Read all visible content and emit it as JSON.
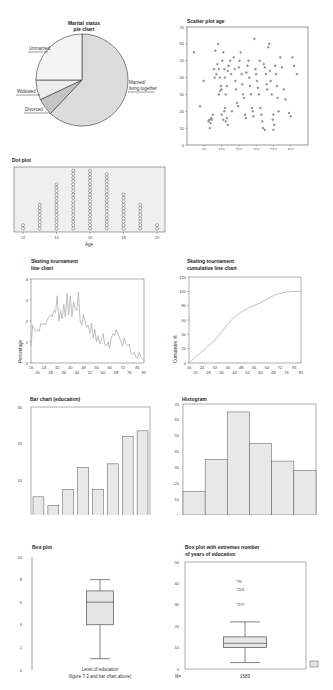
{
  "chart_data": [
    {
      "id": "pie",
      "type": "pie",
      "title": "Marital status pie chart",
      "categories": [
        "Married/ living together",
        "Divorced",
        "Widowed",
        "Unmarried"
      ],
      "values": [
        62,
        6,
        7,
        25
      ],
      "colors": [
        "#dcdcdc",
        "#c4c4c4",
        "#ececec",
        "#f4f4f4"
      ]
    },
    {
      "id": "scatter",
      "type": "scatter",
      "title": "Scatter plot age",
      "xlim": [
        0,
        350
      ],
      "ylim": [
        0,
        70
      ],
      "xticks": [
        50,
        100,
        150,
        200,
        250,
        300
      ],
      "yticks": [
        0,
        10,
        20,
        30,
        40,
        50,
        60,
        70
      ],
      "points": [
        [
          20,
          55
        ],
        [
          38,
          23
        ],
        [
          48,
          38
        ],
        [
          62,
          14
        ],
        [
          65,
          15
        ],
        [
          68,
          13
        ],
        [
          70,
          16
        ],
        [
          72,
          15
        ],
        [
          66,
          10
        ],
        [
          75,
          18
        ],
        [
          78,
          45
        ],
        [
          80,
          40
        ],
        [
          82,
          56
        ],
        [
          85,
          42
        ],
        [
          88,
          48
        ],
        [
          90,
          60
        ],
        [
          92,
          45
        ],
        [
          95,
          40
        ],
        [
          98,
          35
        ],
        [
          100,
          33
        ],
        [
          92,
          30
        ],
        [
          96,
          32
        ],
        [
          100,
          18
        ],
        [
          105,
          15
        ],
        [
          108,
          20
        ],
        [
          110,
          22
        ],
        [
          112,
          14
        ],
        [
          115,
          16
        ],
        [
          118,
          12
        ],
        [
          102,
          50
        ],
        [
          105,
          55
        ],
        [
          108,
          45
        ],
        [
          110,
          40
        ],
        [
          112,
          30
        ],
        [
          115,
          35
        ],
        [
          118,
          44
        ],
        [
          120,
          47
        ],
        [
          125,
          50
        ],
        [
          128,
          42
        ],
        [
          130,
          20
        ],
        [
          135,
          52
        ],
        [
          138,
          45
        ],
        [
          140,
          38
        ],
        [
          142,
          33
        ],
        [
          145,
          25
        ],
        [
          148,
          23
        ],
        [
          150,
          46
        ],
        [
          152,
          50
        ],
        [
          155,
          55
        ],
        [
          158,
          42
        ],
        [
          160,
          36
        ],
        [
          162,
          30
        ],
        [
          165,
          28
        ],
        [
          168,
          18
        ],
        [
          170,
          16
        ],
        [
          172,
          43
        ],
        [
          175,
          47
        ],
        [
          178,
          50
        ],
        [
          180,
          40
        ],
        [
          182,
          35
        ],
        [
          185,
          30
        ],
        [
          188,
          22
        ],
        [
          190,
          20
        ],
        [
          192,
          17
        ],
        [
          195,
          63
        ],
        [
          198,
          45
        ],
        [
          200,
          42
        ],
        [
          202,
          38
        ],
        [
          205,
          34
        ],
        [
          208,
          30
        ],
        [
          210,
          50
        ],
        [
          212,
          22
        ],
        [
          215,
          18
        ],
        [
          218,
          14
        ],
        [
          220,
          10
        ],
        [
          222,
          48
        ],
        [
          225,
          46
        ],
        [
          228,
          42
        ],
        [
          230,
          36
        ],
        [
          232,
          33
        ],
        [
          235,
          58
        ],
        [
          238,
          60
        ],
        [
          240,
          44
        ],
        [
          242,
          38
        ],
        [
          245,
          30
        ],
        [
          248,
          15
        ],
        [
          250,
          18
        ],
        [
          252,
          12
        ],
        [
          255,
          47
        ],
        [
          258,
          42
        ],
        [
          260,
          35
        ],
        [
          262,
          28
        ],
        [
          265,
          20
        ],
        [
          270,
          52
        ],
        [
          275,
          46
        ],
        [
          280,
          33
        ],
        [
          285,
          27
        ],
        [
          295,
          19
        ],
        [
          300,
          17
        ],
        [
          305,
          52
        ],
        [
          310,
          47
        ],
        [
          318,
          42
        ],
        [
          250,
          9
        ],
        [
          225,
          9
        ]
      ]
    },
    {
      "id": "dotplot",
      "type": "scatter",
      "title": "Dot plot",
      "xlabel": "Age",
      "xticks": [
        12,
        14,
        16,
        18,
        20
      ],
      "categories": [
        12,
        13,
        14,
        15,
        16,
        17,
        18,
        19,
        20
      ],
      "values": [
        2,
        8,
        14,
        18,
        18,
        17,
        11,
        8,
        2
      ]
    },
    {
      "id": "line",
      "type": "line",
      "title": "Skating tournament line chart",
      "ylabel": "Percentage",
      "ylim": [
        0,
        4
      ],
      "yticks": [
        0,
        1,
        2,
        3,
        4
      ],
      "xticks_top": [
        16,
        24,
        32,
        40,
        48,
        56,
        64,
        72,
        81
      ],
      "xticks_bottom": [
        20,
        28,
        36,
        44,
        52,
        60,
        68,
        76,
        85
      ],
      "x": [
        16,
        17,
        18,
        19,
        20,
        21,
        22,
        23,
        24,
        25,
        26,
        27,
        28,
        29,
        30,
        31,
        32,
        33,
        34,
        35,
        36,
        37,
        38,
        39,
        40,
        41,
        42,
        43,
        44,
        45,
        46,
        47,
        48,
        49,
        50,
        51,
        52,
        53,
        54,
        55,
        56,
        57,
        58,
        59,
        60,
        61,
        62,
        63,
        64,
        65,
        66,
        67,
        68,
        69,
        70,
        71,
        72,
        73,
        74,
        75,
        76,
        77,
        78,
        79,
        80,
        81,
        82,
        83,
        84,
        85
      ],
      "values": [
        0.8,
        1.8,
        1.6,
        1.5,
        1.6,
        1.5,
        1.9,
        1.8,
        1.9,
        1.8,
        2.1,
        2.2,
        2.3,
        2.2,
        2.5,
        2.4,
        3.2,
        2.0,
        2.5,
        2.1,
        2.8,
        2.2,
        3.3,
        2.3,
        3.2,
        2.2,
        2.9,
        2.6,
        2.5,
        3.4,
        2.0,
        1.8,
        2.3,
        2.0,
        1.7,
        1.8,
        1.4,
        1.9,
        1.2,
        1.6,
        1.0,
        1.3,
        0.9,
        1.1,
        1.4,
        0.9,
        0.8,
        1.0,
        0.7,
        1.2,
        1.4,
        1.3,
        1.6,
        1.4,
        1.2,
        1.0,
        0.8,
        1.2,
        0.9,
        0.8,
        0.9,
        0.5,
        0.4,
        0.5,
        0.3,
        0.2,
        0.5,
        0.3,
        0.2,
        0.1
      ]
    },
    {
      "id": "cumulative",
      "type": "line",
      "title": "Skating tournament cumulative line chart",
      "ylabel": "Cumulative %",
      "ylim": [
        0,
        120
      ],
      "yticks": [
        0,
        20,
        40,
        60,
        80,
        100,
        120
      ],
      "xticks_top": [
        16,
        24,
        32,
        40,
        48,
        56,
        64,
        72,
        81
      ],
      "xticks_bottom": [
        20,
        28,
        36,
        44,
        52,
        60,
        68,
        76,
        85
      ],
      "x": [
        16,
        20,
        24,
        28,
        32,
        36,
        40,
        44,
        48,
        52,
        56,
        60,
        64,
        68,
        72,
        76,
        81,
        85
      ],
      "values": [
        0,
        8,
        16,
        24,
        32,
        43,
        55,
        64,
        71,
        76,
        80,
        84,
        89,
        94,
        97,
        99,
        100,
        100
      ]
    },
    {
      "id": "bar",
      "type": "bar",
      "title": "Bar chart (education)",
      "ylim": [
        0,
        30
      ],
      "yticks": [
        0,
        10,
        20,
        30
      ],
      "categories": [
        "LO",
        "LBO",
        "MAVO",
        "MBO",
        "HAVO",
        "VWO",
        "HBO",
        "WO"
      ],
      "values": [
        5.5,
        3.2,
        7.5,
        13.5,
        7.5,
        14.5,
        22,
        23.5
      ]
    },
    {
      "id": "histogram",
      "type": "bar",
      "title": "Histogram",
      "ylim": [
        0,
        70
      ],
      "yticks": [
        0,
        10,
        20,
        30,
        40,
        50,
        60,
        70
      ],
      "xticks": [
        "1.0",
        "2.0",
        "3.0",
        "4.0",
        "5.0",
        "6.0"
      ],
      "values": [
        15,
        35,
        65,
        45,
        34,
        28
      ]
    },
    {
      "id": "boxplot",
      "type": "box",
      "title": "Box plot",
      "ylim": [
        0,
        10
      ],
      "yticks": [
        0,
        2,
        4,
        6,
        8,
        10
      ],
      "xlabel": "Level of education",
      "caption": "(figure 7.3 and bar chart above)",
      "min": 1,
      "q1": 4,
      "median": 6,
      "q3": 7,
      "max": 8
    },
    {
      "id": "boxplot-extremes",
      "type": "box",
      "title": "Box plot with extremes number of years of education",
      "ylim": [
        0,
        50
      ],
      "yticks": [
        0,
        10,
        20,
        30,
        40,
        50
      ],
      "n_label": "N=",
      "n_value": "1589",
      "min": 3,
      "q1": 10,
      "median": 12,
      "q3": 15,
      "max": 22,
      "extremes": [
        {
          "label": "95",
          "value": 41
        },
        {
          "label": "203",
          "value": 37
        },
        {
          "label": "379",
          "value": 30
        }
      ]
    }
  ],
  "labels": {
    "pie_title_1": "Marital status",
    "pie_title_2": "pie chart",
    "pie_married_1": "Married/",
    "pie_married_2": "living together",
    "pie_divorced": "Divorced",
    "pie_widowed": "Widowed",
    "pie_unmarried": "Unmarried",
    "scatter_title": "Scatter plot age",
    "dot_title": "Dot plot",
    "dot_xlabel": "Age",
    "line_title_1": "Skating tournament",
    "line_title_2": "line chart",
    "line_ylabel": "Percentage",
    "cum_title_1": "Skating tournament",
    "cum_title_2": "cumulative line chart",
    "cum_ylabel": "Cumulative %",
    "bar_title": "Bar chart (education)",
    "hist_title": "Histogram",
    "box_title": "Box plot",
    "box_xlabel": "Level of education",
    "box_caption": "(figure 7.3 and bar chart above)",
    "boxe_title_1": "Box plot with extremes number",
    "boxe_title_2": "of years of education",
    "boxe_n": "N=",
    "boxe_nval": "1589"
  }
}
